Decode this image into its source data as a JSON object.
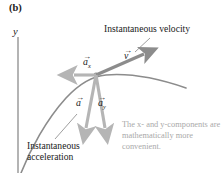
{
  "figure": {
    "panel_label": "(b)",
    "axis_y_label": "y"
  },
  "annotations": {
    "velocity_label": "Instantaneous velocity",
    "acceleration_label_line1": "Instantaneous",
    "acceleration_label_line2": "acceleration",
    "note": "The x- and y-components are mathematically more convenient."
  },
  "vectors": {
    "velocity": {
      "symbol": "v",
      "subscript": ""
    },
    "accel_x": {
      "symbol": "a",
      "subscript": "x"
    },
    "accel": {
      "symbol": "a",
      "subscript": ""
    },
    "accel_y": {
      "symbol": "a",
      "subscript": "y"
    },
    "arrow_glyph": "→"
  },
  "colors": {
    "curve": "#8c8c8c",
    "velocity_arrow": "#8c8c8c",
    "accel_arrow": "#b5b5b5",
    "axis": "#8c8c8c",
    "text": "#1a1a1a",
    "note_text": "#a9a9a9",
    "leader_line": "#8c8c8c"
  }
}
